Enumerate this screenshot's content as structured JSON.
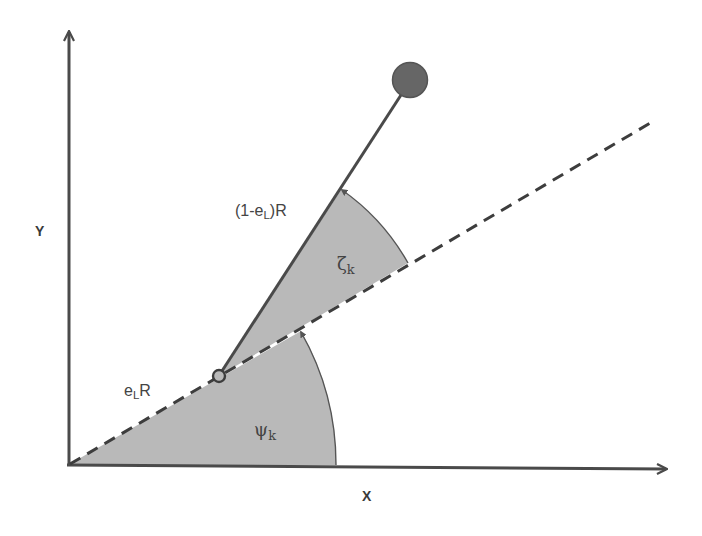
{
  "diagram": {
    "type": "geometry-schematic",
    "colors": {
      "background": "#ffffff",
      "axis": "#4a4a4a",
      "line": "#4a4a4a",
      "sector_fill": "#b9b9b9",
      "ball_fill": "#666666",
      "text": "#444444"
    },
    "axes": {
      "x_label": "X",
      "y_label": "Y"
    },
    "labels": {
      "hinge_offset": {
        "base": "e",
        "sub": "L",
        "suffix": "R"
      },
      "link_length": {
        "prefix": "(1-e",
        "sub": "L",
        "suffix": ")R"
      },
      "angle_psi": {
        "symbol": "ψ",
        "sub": "k"
      },
      "angle_zeta": {
        "symbol": "ζ",
        "sub": "k"
      }
    },
    "geometry": {
      "origin": [
        68,
        465
      ],
      "y_axis_top": [
        69,
        30
      ],
      "x_axis_end": [
        668,
        469
      ],
      "dashed_line_end": [
        652,
        122
      ],
      "hinge": {
        "center": [
          219,
          376
        ],
        "radius": 6
      },
      "ball": {
        "center": [
          410,
          80
        ],
        "radius": 18
      },
      "psi_sector_radius": 268,
      "zeta_sector_radius": 222
    }
  }
}
